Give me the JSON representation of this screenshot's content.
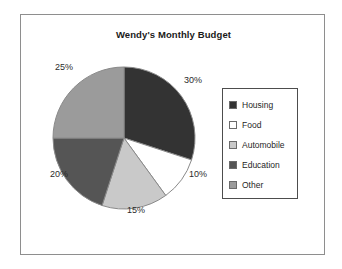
{
  "chart_data": {
    "type": "pie",
    "title": "Wendy's Monthly Budget",
    "xlabel": "",
    "ylabel": "",
    "legend_position": "right",
    "grid": false,
    "start_angle_deg": 0,
    "direction": "clockwise",
    "categories": [
      "Housing",
      "Food",
      "Automobile",
      "Education",
      "Other"
    ],
    "values": [
      30,
      10,
      15,
      20,
      25
    ],
    "value_unit": "%",
    "data_labels": [
      "30%",
      "10%",
      "15%",
      "20%",
      "25%"
    ],
    "colors": [
      "#333333",
      "#ffffff",
      "#c9c9c9",
      "#555555",
      "#9b9b9b"
    ],
    "slices": [
      {
        "label": "Housing",
        "value": 30,
        "display": "30%",
        "color": "#333333"
      },
      {
        "label": "Food",
        "value": 10,
        "display": "10%",
        "color": "#ffffff"
      },
      {
        "label": "Automobile",
        "value": 15,
        "display": "15%",
        "color": "#c9c9c9"
      },
      {
        "label": "Education",
        "value": 20,
        "display": "20%",
        "color": "#555555"
      },
      {
        "label": "Other",
        "value": 25,
        "display": "25%",
        "color": "#9b9b9b"
      }
    ]
  },
  "legend": {
    "items": [
      {
        "label": "Housing",
        "color": "#333333"
      },
      {
        "label": "Food",
        "color": "#ffffff"
      },
      {
        "label": "Automobile",
        "color": "#c9c9c9"
      },
      {
        "label": "Education",
        "color": "#555555"
      },
      {
        "label": "Other",
        "color": "#9b9b9b"
      }
    ]
  },
  "style": {
    "frame_color": "#8e8e8e",
    "background": "#ffffff",
    "text_color": "#2b2b2b"
  }
}
